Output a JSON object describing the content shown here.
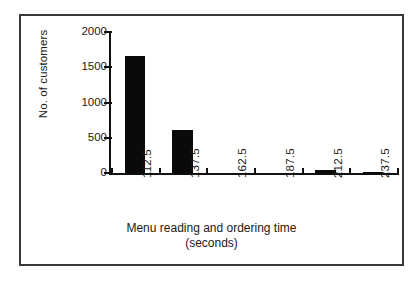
{
  "chart_data": {
    "type": "bar",
    "title": "",
    "subtitle": "",
    "categories": [
      "112.5",
      "137.5",
      "162.5",
      "187.5",
      "212.5",
      "237.5"
    ],
    "values": [
      1680,
      630,
      0,
      0,
      55,
      25
    ],
    "xlabel": "Menu reading and ordering time",
    "xlabel_line2": "(seconds)",
    "ylabel": "No. of customers",
    "ylim": [
      0,
      2000
    ],
    "yticks": [
      0,
      500,
      1000,
      1500,
      2000
    ],
    "ytick_labels": [
      "0",
      "500",
      "1000",
      "1500",
      "2000"
    ],
    "grid": false,
    "legend": false,
    "bar_color": "#0a0a0a",
    "axis_color": "#111111",
    "frame_color": "#3a3a3c",
    "background": "#ffffff"
  }
}
